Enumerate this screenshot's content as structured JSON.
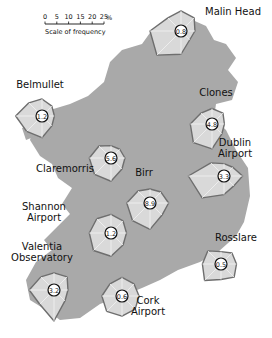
{
  "legend": {
    "ticks": [
      "0",
      "5",
      "10",
      "15",
      "20",
      "25"
    ],
    "unit": "%",
    "caption": "Scale of frequency"
  },
  "colors": {
    "land": "#a9a9a9",
    "rose_fill": "#d9d9d9",
    "rose_stroke": "#6e6e6e",
    "calm_circle": "#ffffff"
  },
  "directions": [
    "N",
    "NE",
    "E",
    "SE",
    "S",
    "SW",
    "W",
    "NW"
  ],
  "stations": [
    {
      "name": "Malin Head",
      "lines": [
        "Malin Head"
      ],
      "calm": "0.8",
      "freq": [
        13,
        12,
        9,
        8,
        15,
        22,
        20,
        12
      ]
    },
    {
      "name": "Belmullet",
      "lines": [
        "Belmullet"
      ],
      "calm": "1.2",
      "freq": [
        11,
        9,
        8,
        9,
        14,
        14,
        17,
        12
      ]
    },
    {
      "name": "Clones",
      "lines": [
        "Clones"
      ],
      "calm": "4.8",
      "freq": [
        10,
        10,
        8,
        9,
        16,
        17,
        14,
        10
      ]
    },
    {
      "name": "Claremorris",
      "lines": [
        "Claremorris"
      ],
      "calm": "5.6",
      "freq": [
        8,
        8,
        9,
        10,
        15,
        15,
        14,
        11
      ]
    },
    {
      "name": "Dublin Airport",
      "lines": [
        "Dublin",
        "Airport"
      ],
      "calm": "3.3",
      "freq": [
        8,
        8,
        12,
        9,
        12,
        20,
        23,
        12
      ]
    },
    {
      "name": "Birr",
      "lines": [
        "Birr"
      ],
      "calm": "8.9",
      "freq": [
        9,
        10,
        12,
        11,
        17,
        16,
        15,
        11
      ]
    },
    {
      "name": "Shannon Airport",
      "lines": [
        "Shannon",
        "Airport"
      ],
      "calm": "1.2",
      "freq": [
        12,
        11,
        10,
        11,
        15,
        16,
        14,
        13
      ]
    },
    {
      "name": "Valentia Observatory",
      "lines": [
        "Valentia",
        "Observatory"
      ],
      "calm": "3.2",
      "freq": [
        11,
        12,
        9,
        10,
        20,
        13,
        16,
        12
      ]
    },
    {
      "name": "Cork Airport",
      "lines": [
        "Cork",
        "Airport"
      ],
      "calm": "0.6",
      "freq": [
        12,
        11,
        11,
        12,
        13,
        14,
        13,
        11
      ]
    },
    {
      "name": "Rosslare",
      "lines": [
        "Rosslare"
      ],
      "calm": "0.5",
      "freq": [
        8,
        10,
        10,
        12,
        10,
        15,
        12,
        12
      ]
    }
  ]
}
